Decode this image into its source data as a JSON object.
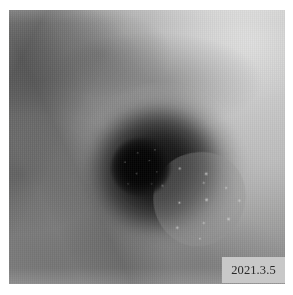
{
  "page": {
    "background_color": "#ffffff"
  },
  "photograph": {
    "name": "clinical-skin-lesion-photo",
    "modality": "grayscale clinical photograph",
    "subject": "skin lesion with central black necrotic eschar, surrounding dark halo and granular crust",
    "alt_text": "Grayscale close-up photograph of a skin ulcer with a black necrotic eschar at its center, surrounded by a dark ring and pale granular crust",
    "regions": {
      "core_label": "necrotic eschar",
      "inner_label": "dark inner zone",
      "halo_label": "diffuse halo",
      "crust_label": "granular crust"
    },
    "tones": {
      "core": "#060606",
      "inner": "#191919",
      "halo": "#343434",
      "crust": "#b8b8b6",
      "skin_light": "#d6d6d4",
      "skin_mid": "#9d9d9b",
      "skin_dark": "#6f6f6d"
    }
  },
  "date_stamp": {
    "text": "2021.3.5",
    "background_color": "#c7c7c5",
    "text_color": "#2a2a2a"
  }
}
